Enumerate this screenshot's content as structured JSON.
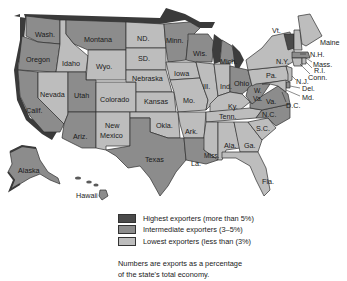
{
  "colors": {
    "highest": "#4a4a4a",
    "intermediate": "#8c8c8c",
    "lowest": "#bdbdbd",
    "water": "#3c3c3c",
    "border_shadow": "#3a3a3a"
  },
  "legend": {
    "items": [
      {
        "key": "highest",
        "label": "Highest exporters (more than 5%)"
      },
      {
        "key": "intermediate",
        "label": "Intermediate exporters (3–5%)"
      },
      {
        "key": "lowest",
        "label": "Lowest exporters (less than (3%)"
      }
    ],
    "note_line1": "Numbers are exports as a percentage",
    "note_line2": "of the state's total economy."
  },
  "states": {
    "wash": {
      "label": "Wash.",
      "category": "intermediate"
    },
    "oregon": {
      "label": "Oregon",
      "category": "intermediate"
    },
    "calif": {
      "label": "Calif.",
      "category": "intermediate"
    },
    "idaho": {
      "label": "Idaho",
      "category": "lowest"
    },
    "nevada": {
      "label": "Nevada",
      "category": "lowest"
    },
    "montana": {
      "label": "Montana",
      "category": "intermediate"
    },
    "wyo": {
      "label": "Wyo.",
      "category": "lowest"
    },
    "utah": {
      "label": "Utah",
      "category": "intermediate"
    },
    "colorado": {
      "label": "Colorado",
      "category": "lowest"
    },
    "ariz": {
      "label": "Ariz.",
      "category": "intermediate"
    },
    "new_mexico_1": {
      "label": "New",
      "category": "lowest"
    },
    "new_mexico_2": {
      "label": "Mexico",
      "category": "lowest"
    },
    "nd": {
      "label": "ND.",
      "category": "lowest"
    },
    "sd": {
      "label": "SD.",
      "category": "lowest"
    },
    "nebraska": {
      "label": "Nebraska",
      "category": "lowest"
    },
    "kansas": {
      "label": "Kansas",
      "category": "lowest"
    },
    "okla": {
      "label": "Okla.",
      "category": "lowest"
    },
    "texas": {
      "label": "Texas",
      "category": "intermediate"
    },
    "minn": {
      "label": "Minn.",
      "category": "intermediate"
    },
    "iowa": {
      "label": "Iowa",
      "category": "lowest"
    },
    "mo": {
      "label": "Mo.",
      "category": "lowest"
    },
    "ark": {
      "label": "Ark.",
      "category": "lowest"
    },
    "la": {
      "label": "La.",
      "category": "intermediate"
    },
    "wis": {
      "label": "Wis.",
      "category": "intermediate"
    },
    "ill": {
      "label": "Ill.",
      "category": "lowest"
    },
    "mich": {
      "label": "Mich.",
      "category": "intermediate"
    },
    "ind": {
      "label": "Ind.",
      "category": "lowest"
    },
    "ohio": {
      "label": "Ohio",
      "category": "intermediate"
    },
    "ky": {
      "label": "Ky.",
      "category": "lowest"
    },
    "tenn": {
      "label": "Tenn.",
      "category": "lowest"
    },
    "miss": {
      "label": "Miss.",
      "category": "lowest"
    },
    "ala": {
      "label": "Ala.",
      "category": "lowest"
    },
    "ga": {
      "label": "Ga.",
      "category": "lowest"
    },
    "fla": {
      "label": "Fla.",
      "category": "lowest"
    },
    "sc": {
      "label": "S.C.",
      "category": "lowest"
    },
    "nc": {
      "label": "N.C.",
      "category": "intermediate"
    },
    "va": {
      "label": "Va.",
      "category": "intermediate"
    },
    "wva_1": {
      "label": "W.",
      "category": "intermediate"
    },
    "wva_2": {
      "label": "Va.",
      "category": "intermediate"
    },
    "pa": {
      "label": "Pa.",
      "category": "lowest"
    },
    "ny": {
      "label": "N.Y.",
      "category": "lowest"
    },
    "vt": {
      "label": "Vt.",
      "category": "highest"
    },
    "nh": {
      "label": "N.H.",
      "category": "lowest"
    },
    "maine": {
      "label": "Maine",
      "category": "lowest"
    },
    "mass": {
      "label": "Mass.",
      "category": "intermediate"
    },
    "ri": {
      "label": "R.I.",
      "category": "lowest"
    },
    "conn": {
      "label": "Conn.",
      "category": "lowest"
    },
    "nj": {
      "label": "N.J.",
      "category": "lowest"
    },
    "del": {
      "label": "Del.",
      "category": "intermediate"
    },
    "md": {
      "label": "Md.",
      "category": "lowest"
    },
    "dc": {
      "label": "D.C.",
      "category": "lowest"
    },
    "alaska": {
      "label": "Alaska",
      "category": "intermediate"
    },
    "hawaii": {
      "label": "Hawaii",
      "category": "intermediate"
    }
  }
}
